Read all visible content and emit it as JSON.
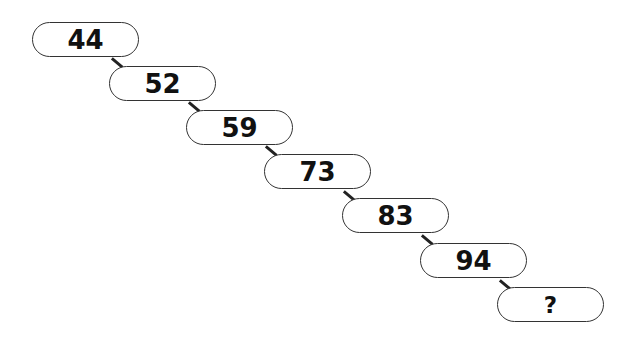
{
  "puzzle": {
    "type": "number-sequence",
    "items": [
      {
        "label": "44",
        "x": 32,
        "y": 22
      },
      {
        "label": "52",
        "x": 109,
        "y": 66
      },
      {
        "label": "59",
        "x": 186,
        "y": 110
      },
      {
        "label": "73",
        "x": 264,
        "y": 154
      },
      {
        "label": "83",
        "x": 342,
        "y": 198
      },
      {
        "label": "94",
        "x": 420,
        "y": 243
      },
      {
        "label": "?",
        "x": 497,
        "y": 287
      }
    ]
  }
}
